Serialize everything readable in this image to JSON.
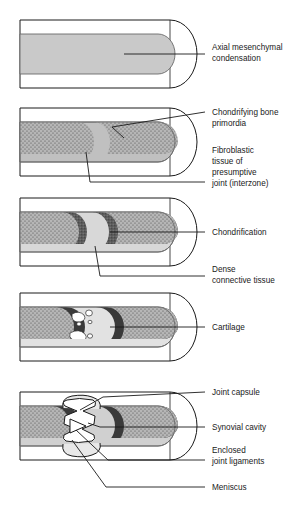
{
  "figure": {
    "type": "diagram",
    "panel_count": 5,
    "background": "#ffffff",
    "line_color": "#1a1a1a",
    "colors": {
      "mesenchyme_gray": "#c9c9c9",
      "stipple_gray": "#b4b4b4",
      "interzone_light": "#d8d8d8",
      "cartilage_dark": "#5a5a5a",
      "cavity_white": "#ffffff",
      "outline": "#1a1a1a"
    }
  },
  "panels": [
    {
      "id": "panel-1",
      "stage_name": "axial-mesenchymal-condensation",
      "labels": [
        "label-axial-mesenchymal-condensation"
      ]
    },
    {
      "id": "panel-2",
      "stage_name": "chondrifying-bone-primordia",
      "labels": [
        "label-chondrifying-bone-primordia",
        "label-fibroblastic-tissue"
      ]
    },
    {
      "id": "panel-3",
      "stage_name": "chondrification",
      "labels": [
        "label-chondrification",
        "label-dense-connective-tissue"
      ]
    },
    {
      "id": "panel-4",
      "stage_name": "cavitation",
      "labels": [
        "label-cartilage"
      ]
    },
    {
      "id": "panel-5",
      "stage_name": "mature-synovial-joint",
      "labels": [
        "label-joint-capsule",
        "label-synovial-cavity",
        "label-enclosed-joint-ligaments",
        "label-meniscus"
      ]
    }
  ],
  "labels": {
    "axial_mesenchymal_condensation": {
      "line1": "Axial mesenchymal",
      "line2": "condensation"
    },
    "chondrifying_bone_primordia": {
      "line1": "Chondrifying bone",
      "line2": "primordia"
    },
    "fibroblastic_tissue": {
      "line1": "Fibroblastic",
      "line2": "tissue of",
      "line3": "presumptive",
      "line4": "joint (interzone)"
    },
    "chondrification": {
      "line1": "Chondrification"
    },
    "dense_connective_tissue": {
      "line1": "Dense",
      "line2": "connective tissue"
    },
    "cartilage": {
      "line1": "Cartilage"
    },
    "joint_capsule": {
      "line1": "Joint capsule"
    },
    "synovial_cavity": {
      "line1": "Synovial cavity"
    },
    "enclosed_joint_ligaments": {
      "line1": "Enclosed",
      "line2": "joint ligaments"
    },
    "meniscus": {
      "line1": "Meniscus"
    }
  }
}
